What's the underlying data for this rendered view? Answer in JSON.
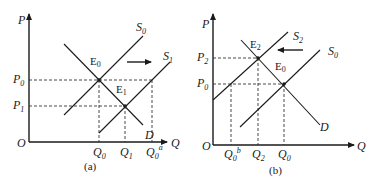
{
  "panels": [
    {
      "id": "a",
      "caption": "(a)",
      "axis": {
        "y_label": "P",
        "x_label": "Q",
        "origin": "O"
      },
      "price_ticks": [
        {
          "base": "P",
          "sub": "0"
        },
        {
          "base": "P",
          "sub": "1"
        }
      ],
      "quantity_ticks": [
        {
          "base": "Q",
          "sub": "0"
        },
        {
          "base": "Q",
          "sub": "1"
        },
        {
          "base": "Q",
          "sub": "0",
          "sup": "a"
        }
      ],
      "curves": [
        {
          "base": "S",
          "sub": "0"
        },
        {
          "base": "S",
          "sub": "1"
        },
        {
          "base": "D",
          "sub": ""
        }
      ],
      "equilibria": [
        {
          "base": "E",
          "sub": "0"
        },
        {
          "base": "E",
          "sub": "1"
        }
      ],
      "shift_direction": "right"
    },
    {
      "id": "b",
      "caption": "(b)",
      "axis": {
        "y_label": "P",
        "x_label": "Q",
        "origin": "O"
      },
      "price_ticks": [
        {
          "base": "P",
          "sub": "2"
        },
        {
          "base": "P",
          "sub": "0"
        }
      ],
      "quantity_ticks": [
        {
          "base": "Q",
          "sub": "0",
          "sup": "b"
        },
        {
          "base": "Q",
          "sub": "2"
        },
        {
          "base": "Q",
          "sub": "0"
        }
      ],
      "curves": [
        {
          "base": "S",
          "sub": "2"
        },
        {
          "base": "S",
          "sub": "0"
        },
        {
          "base": "D",
          "sub": ""
        }
      ],
      "equilibria": [
        {
          "base": "E",
          "sub": "2"
        },
        {
          "base": "E",
          "sub": "0"
        }
      ],
      "shift_direction": "left"
    }
  ]
}
